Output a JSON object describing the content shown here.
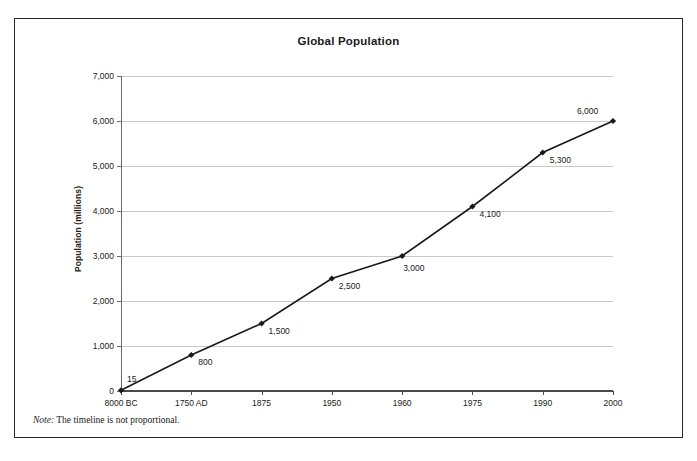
{
  "figure": {
    "title": "Global Population",
    "note_label": "Note:",
    "note_text": " The timeline is not proportional.",
    "border_color": "#2a2a2a"
  },
  "axes": {
    "y_title": "Population (millions)",
    "y_ticks": [
      "7,000",
      "6,000",
      "5,000",
      "4,000",
      "3,000",
      "2,000",
      "1,000",
      "0"
    ],
    "y_tick_values": [
      7000,
      6000,
      5000,
      4000,
      3000,
      2000,
      1000,
      0
    ],
    "x_ticks": [
      "8000 BC",
      "1750 AD",
      "1875",
      "1950",
      "1960",
      "1975",
      "1990",
      "2000"
    ],
    "grid_color": "#c9c9c9",
    "axis_color": "#4a4a4a"
  },
  "chart_data": {
    "type": "line",
    "title": "Global Population",
    "xlabel": "",
    "ylabel": "Population (millions)",
    "ylim": [
      0,
      7000
    ],
    "ytick_step": 1000,
    "grid": "horizontal",
    "legend": "none",
    "series_color": "#1a1a1a",
    "marker": "diamond",
    "categories": [
      "8000 BC",
      "1750 AD",
      "1875",
      "1950",
      "1960",
      "1975",
      "1990",
      "2000"
    ],
    "values": [
      15,
      800,
      1500,
      2500,
      3000,
      4100,
      5300,
      6000
    ],
    "data_labels": [
      "15",
      "800",
      "1,500",
      "2,500",
      "3,000",
      "4,100",
      "5,300",
      "6,000"
    ],
    "annotations": [
      "Note: The timeline is not proportional."
    ]
  },
  "point_label_placement": [
    {
      "label": "15",
      "dx": 6,
      "dy": -16
    },
    {
      "label": "800",
      "dx": 7,
      "dy": 2
    },
    {
      "label": "1,500",
      "dx": 7,
      "dy": 2
    },
    {
      "label": "2,500",
      "dx": 7,
      "dy": 2
    },
    {
      "label": "3,000",
      "dx": 1,
      "dy": 7
    },
    {
      "label": "4,100",
      "dx": 7,
      "dy": 2
    },
    {
      "label": "5,300",
      "dx": 7,
      "dy": 2
    },
    {
      "label": "6,000",
      "dx": -36,
      "dy": -15
    }
  ]
}
